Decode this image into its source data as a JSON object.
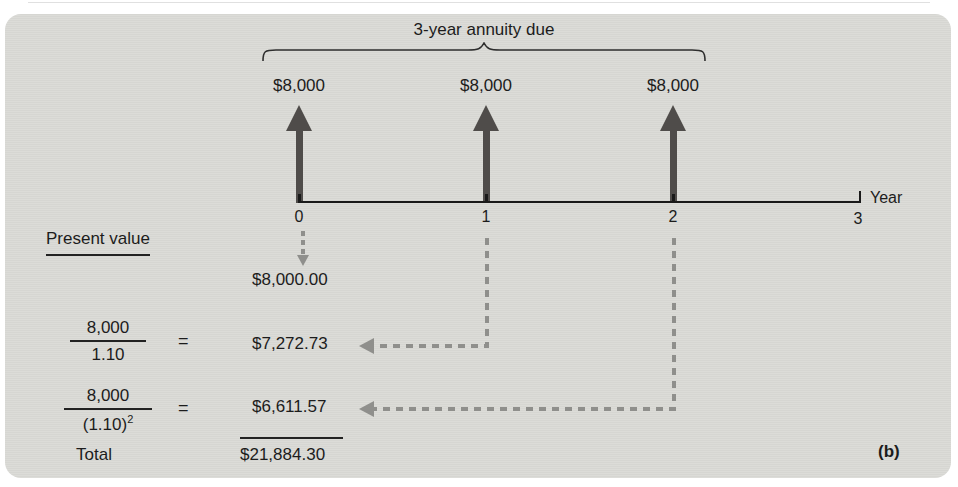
{
  "figure": {
    "title_brace": "3-year annuity due",
    "subfigure_label": "(b)",
    "timeline": {
      "axis_label": "Year",
      "tick_labels": [
        "0",
        "1",
        "2",
        "3"
      ]
    },
    "cash_flows": [
      {
        "year": "0",
        "label": "$8,000"
      },
      {
        "year": "1",
        "label": "$8,000"
      },
      {
        "year": "2",
        "label": "$8,000"
      }
    ],
    "present_value": {
      "heading": "Present value",
      "pv_at_0": "$8,000.00",
      "row1": {
        "numerator": "8,000",
        "denominator": "1.10",
        "equals": "=",
        "value": "$7,272.73"
      },
      "row2": {
        "numerator": "8,000",
        "denominator_base": "(1.10)",
        "denominator_exponent": "2",
        "equals": "=",
        "value": "$6,611.57"
      },
      "total_label": "Total",
      "total_value": "$21,884.30"
    },
    "colors": {
      "panel_background": "#dadad6",
      "solid_arrow": "#4f4c4a",
      "dashed_arrow": "#8f8f8c",
      "text": "#1c1c1c",
      "timeline": "#1a1a1a"
    }
  }
}
